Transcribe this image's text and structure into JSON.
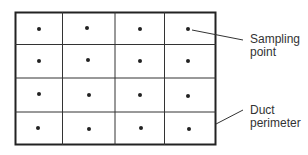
{
  "diagram": {
    "rows": 4,
    "columns": 4,
    "points": [
      [
        [
          39,
          29
        ],
        [
          87,
          28
        ],
        [
          140,
          29
        ],
        [
          188,
          29
        ]
      ],
      [
        [
          39,
          61
        ],
        [
          88,
          60
        ],
        [
          140,
          61
        ],
        [
          188,
          61
        ]
      ],
      [
        [
          39,
          94
        ],
        [
          89,
          95
        ],
        [
          140,
          95
        ],
        [
          188,
          96
        ]
      ],
      [
        [
          38,
          128
        ],
        [
          89,
          129
        ],
        [
          141,
          128
        ],
        [
          189,
          129
        ]
      ]
    ],
    "labels": {
      "sampling_point": [
        "Sampling",
        "point"
      ],
      "duct_perimeter": [
        "Duct",
        "perimeter"
      ]
    },
    "colors": {
      "line": "#222222",
      "dot": "#222222",
      "text": "#333333"
    }
  }
}
